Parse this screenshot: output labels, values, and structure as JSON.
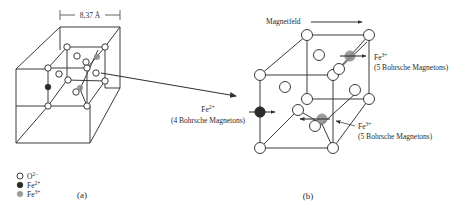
{
  "figure": {
    "panel_a": {
      "caption": "(a)",
      "dimension_label": "8,37 Å",
      "legend": [
        {
          "symbol": "open-circle",
          "label": "O",
          "charge": "2−"
        },
        {
          "symbol": "black-circle",
          "label": "Fe",
          "charge": "2+"
        },
        {
          "symbol": "gray-circle",
          "label": "Fe",
          "charge": "3+"
        }
      ]
    },
    "panel_b": {
      "caption": "(b)",
      "field_label": "Magnetfeld",
      "annotations": [
        {
          "ion": "Fe",
          "charge": "2+",
          "moment": "(4 Bohrsche Magnetons)"
        },
        {
          "ion": "Fe",
          "charge": "3+",
          "moment": "(5 Bohrsche Magnetons)"
        },
        {
          "ion": "Fe",
          "charge": "3+",
          "moment": "(5 Bohrsche Magnetons)"
        }
      ]
    },
    "colors": {
      "line": "#3a3a3a",
      "fe2_fill": "#2b2b2b",
      "fe3_fill": "#8a8a8a",
      "o_fill": "#ffffff"
    }
  }
}
